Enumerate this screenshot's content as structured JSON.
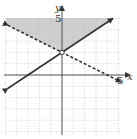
{
  "chart_data": {
    "type": "line",
    "title": "",
    "xlabel": "x",
    "ylabel": "y",
    "xlim": [
      -5,
      5
    ],
    "ylim": [
      -5,
      5
    ],
    "grid": true,
    "x_tick_label": "5",
    "y_tick_label": "5",
    "series": [
      {
        "name": "solid boundary",
        "equation": "y = (2/3)x + 2",
        "style": "solid",
        "x": [
          -5,
          5
        ],
        "y": [
          -1.33,
          5.33
        ],
        "arrows": "both"
      },
      {
        "name": "dashed boundary",
        "equation": "y = -(1/2)x + 2",
        "style": "dashed",
        "x": [
          -5,
          5
        ],
        "y": [
          4.5,
          -0.5
        ],
        "arrows": "both"
      }
    ],
    "points": [
      {
        "x": 0,
        "y": 2,
        "marker": "open-circle",
        "label": ""
      }
    ],
    "shaded_region": "above both lines (y >= (2/3)x + 2 and y > -(1/2)x + 2)",
    "colors": {
      "shade": "#cfcfcf",
      "line": "#333333",
      "grid": "#b8b8b8",
      "axis": "#555555"
    }
  },
  "labels": {
    "x_axis": "x",
    "y_axis": "y",
    "x_tick": "5",
    "y_tick": "5"
  }
}
